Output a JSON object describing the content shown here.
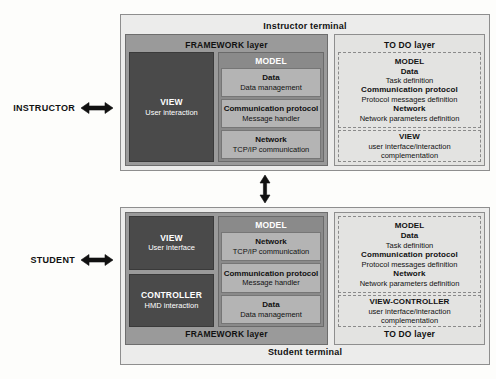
{
  "actors": [
    {
      "id": "instructor",
      "label": "INSTRUCTOR",
      "arrow_icon": "double-headed-horizontal-arrow"
    },
    {
      "id": "student",
      "label": "STUDENT",
      "arrow_icon": "double-headed-horizontal-arrow"
    }
  ],
  "link_arrow": {
    "icon": "double-headed-vertical-arrow",
    "connects": "Instructor terminal ↔ Student terminal"
  },
  "instructor_terminal": {
    "title": "Instructor terminal",
    "framework": {
      "title": "FRAMEWORK layer",
      "left_boxes": [
        {
          "title": "VIEW",
          "subtitle": "User interaction"
        }
      ],
      "model": {
        "title": "MODEL",
        "items": [
          {
            "title": "Data",
            "subtitle": "Data management"
          },
          {
            "title": "Communication protocol",
            "subtitle": "Message handler"
          },
          {
            "title": "Network",
            "subtitle": "TCP/IP communication"
          }
        ]
      }
    },
    "todo": {
      "title": "TO DO layer",
      "groups": [
        {
          "lines": [
            {
              "text": "MODEL",
              "bold": true
            },
            {
              "text": "Data",
              "bold": true
            },
            {
              "text": "Task definition",
              "bold": false
            },
            {
              "text": "Communication protocol",
              "bold": true
            },
            {
              "text": "Protocol messages definition",
              "bold": false
            },
            {
              "text": "Network",
              "bold": true
            },
            {
              "text": "Network parameters definition",
              "bold": false
            }
          ]
        },
        {
          "lines": [
            {
              "text": "VIEW",
              "bold": true
            },
            {
              "text": "user interface/interaction",
              "bold": false
            },
            {
              "text": "complementation",
              "bold": false
            }
          ]
        }
      ]
    }
  },
  "student_terminal": {
    "title": "Student terminal",
    "framework": {
      "title": "FRAMEWORK layer",
      "left_boxes": [
        {
          "title": "VIEW",
          "subtitle": "User interface"
        },
        {
          "title": "CONTROLLER",
          "subtitle": "HMD interaction"
        }
      ],
      "model": {
        "title": "MODEL",
        "items": [
          {
            "title": "Network",
            "subtitle": "TCP/IP communication"
          },
          {
            "title": "Communication protocol",
            "subtitle": "Message handler"
          },
          {
            "title": "Data",
            "subtitle": "Data management"
          }
        ]
      }
    },
    "todo": {
      "title": "TO DO layer",
      "groups": [
        {
          "lines": [
            {
              "text": "MODEL",
              "bold": true
            },
            {
              "text": "Data",
              "bold": true
            },
            {
              "text": "Task definition",
              "bold": false
            },
            {
              "text": "Communication protocol",
              "bold": true
            },
            {
              "text": "Protocol messages definition",
              "bold": false
            },
            {
              "text": "Network",
              "bold": true
            },
            {
              "text": "Network parameters definition",
              "bold": false
            }
          ]
        },
        {
          "lines": [
            {
              "text": "VIEW-CONTROLLER",
              "bold": true
            },
            {
              "text": "user interface/interaction",
              "bold": false
            },
            {
              "text": "complementation",
              "bold": false
            }
          ]
        }
      ]
    }
  },
  "colors": {
    "page_background": "#fdfdfb",
    "terminal_background": "#ececeb",
    "framework_layer": "#9a9a9a",
    "model_box": "#8a8a8a",
    "model_item": "#b4b4b4",
    "dark_box": "#4a4a4a",
    "todo_layer": "#e3e3e1",
    "border": "#8e8e8e",
    "text": "#1a1a1a",
    "inverse_text": "#ffffff"
  }
}
